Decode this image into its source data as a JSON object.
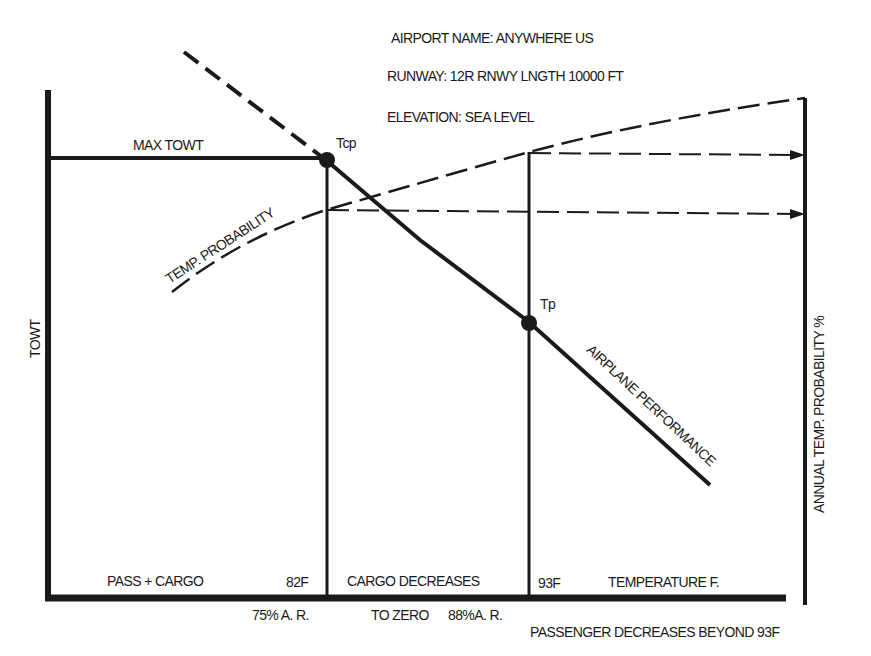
{
  "header": {
    "airport_name": "AIRPORT NAME: ANYWHERE  US",
    "runway": "RUNWAY: 12R   RNWY LNGTH  10000 FT",
    "elevation": "ELEVATION: SEA LEVEL"
  },
  "axes": {
    "y_left_label": "TOWT",
    "y_right_label": "ANNUAL TEMP. PROBABILITY %",
    "x_label": "TEMPERATURE  F."
  },
  "curves": {
    "max_towt": "MAX  TOWT",
    "temp_probability": "TEMP. PROBABILITY",
    "airplane_performance": "AIRPLANE PERFORMANCE"
  },
  "points": {
    "tcp": "Tcp",
    "tp": "Tp"
  },
  "regions": {
    "pass_cargo": "PASS + CARGO",
    "temp_82": "82F",
    "cargo_decreases": "CARGO DECREASES",
    "temp_93": "93F"
  },
  "below_axis": {
    "ar_75": "75% A. R.",
    "to_zero": "TO ZERO",
    "ar_88": "88%A. R.",
    "passenger_decreases": "PASSENGER DECREASES   BEYOND 93F"
  },
  "colors": {
    "ink": "#1a1a1a",
    "background": "#ffffff"
  }
}
